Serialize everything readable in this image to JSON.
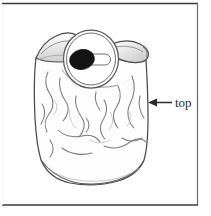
{
  "figure": {
    "kind": "line-art-illustration",
    "background_color": "#ffffff",
    "ink_color": "#3b3b3b",
    "border": {
      "top_color": "#3a3a3a",
      "right_color": "#6a6a6a",
      "bottom_color": "#3a3a3a",
      "left_color": "#f2f2f2",
      "width_px": 1
    }
  },
  "annotations": {
    "top_label": {
      "text": "top",
      "arrow": "left-arrow-icon",
      "arrow_direction": "left",
      "text_color": "#2b2b2b",
      "font_size_px": 13
    }
  },
  "opening": {
    "outer_ring_color": "#5a5a5a",
    "inner_ring_color": "#6e6e6e",
    "fill_color": "#ffffff",
    "blob": {
      "name": "dark-oval-blob",
      "color": "#141414"
    },
    "capsule": {
      "name": "white-capsule",
      "fill_color": "#ffffff",
      "stroke_color": "#6a6a6a"
    }
  },
  "bag": {
    "body_fill": "#fdfdfd",
    "outline_color": "#4a4a4a",
    "crease_color": "#7b7b7b",
    "shadow_color": "#cfcfcf"
  }
}
